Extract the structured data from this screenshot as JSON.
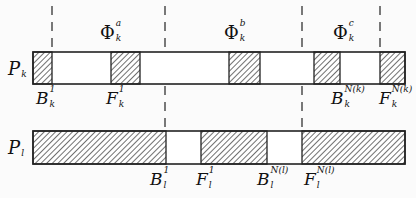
{
  "diagram": {
    "type": "timeline-interval-diagram",
    "rows": [
      {
        "id": "Pk",
        "label": {
          "base": "P",
          "sub": "k"
        },
        "bar": {
          "x0": 33,
          "x1": 405,
          "y": 52,
          "h": 32
        },
        "hatched_segments": [
          [
            33,
            52
          ],
          [
            111,
            140
          ],
          [
            229,
            260
          ],
          [
            314,
            340
          ],
          [
            380,
            405
          ]
        ]
      },
      {
        "id": "Pl",
        "label": {
          "base": "P",
          "sub": "l"
        },
        "bar": {
          "x0": 33,
          "x1": 405,
          "y": 131,
          "h": 33
        },
        "hatched_segments": [
          [
            33,
            166
          ],
          [
            201,
            267
          ],
          [
            302,
            405
          ]
        ]
      }
    ],
    "dashed_lines": [
      52,
      165,
      302,
      380
    ],
    "phase_labels": [
      {
        "base": "Φ",
        "sup": "a",
        "sub": "k"
      },
      {
        "base": "Φ",
        "sup": "b",
        "sub": "k"
      },
      {
        "base": "Φ",
        "sup": "c",
        "sub": "k"
      }
    ],
    "top_markers": [
      {
        "base": "B",
        "sup": "1",
        "sub": "k"
      },
      {
        "base": "F",
        "sup": "1",
        "sub": "k"
      },
      {
        "base": "B",
        "sup": "N(k)",
        "sub": "k"
      },
      {
        "base": "F",
        "sup": "N(k)",
        "sub": "k"
      }
    ],
    "bottom_markers": [
      {
        "base": "B",
        "sup": "1",
        "sub": "l"
      },
      {
        "base": "F",
        "sup": "1",
        "sub": "l"
      },
      {
        "base": "B",
        "sup": "N(l)",
        "sub": "l"
      },
      {
        "base": "F",
        "sup": "N(l)",
        "sub": "l"
      }
    ],
    "colors": {
      "line": "#222222",
      "hatch": "#333333",
      "fill": "#ffffff",
      "background": "#fbfbfb"
    }
  }
}
